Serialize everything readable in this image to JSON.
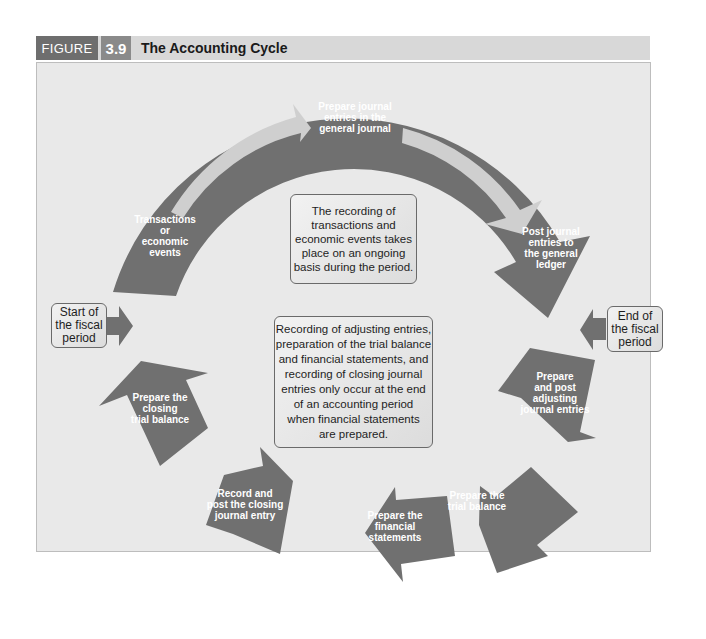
{
  "figure": {
    "label": "FIGURE",
    "number": "3.9",
    "title": "The Accounting Cycle"
  },
  "colors": {
    "arrow_fill": "#707070",
    "inner_arrow_fill": "#cfcfcf",
    "panel_background": "#e9e9e9",
    "header_background": "#d8d8d8",
    "figure_label_background": "#6e6e6e",
    "figure_number_background": "#8a8a8a"
  },
  "boxes": {
    "start": "Start of the fiscal period",
    "end": "End of the fiscal period",
    "ongoing_note": "The recording of transactions and economic events takes place on an ongoing basis during the period.",
    "end_of_period_note": "Recording of adjusting entries, preparation of the trial balance and financial statements, and recording of closing journal entries only occur at the end of an accounting period when financial statements are prepared."
  },
  "arc_steps": [
    {
      "id": "transactions",
      "label": "Transactions or economic events"
    },
    {
      "id": "journal-entries",
      "label": "Prepare journal entries in the general journal"
    },
    {
      "id": "post-ledger",
      "label": "Post journal entries to the general ledger"
    }
  ],
  "end_steps": [
    {
      "id": "adjusting",
      "label": "Prepare and post adjusting journal entries"
    },
    {
      "id": "trial-balance",
      "label": "Prepare the trial balance"
    },
    {
      "id": "financial-statements",
      "label": "Prepare the financial statements"
    },
    {
      "id": "closing-entry",
      "label": "Record and post the closing journal entry"
    },
    {
      "id": "closing-trial-balance",
      "label": "Prepare the closing trial balance"
    }
  ],
  "text": {
    "transactions": [
      "Transactions",
      "or",
      "economic",
      "events"
    ],
    "journal": [
      "Prepare journal",
      "entries in the",
      "general journal"
    ],
    "post": [
      "Post journal",
      "entries to",
      "the general",
      "ledger"
    ],
    "adjusting": [
      "Prepare",
      "and post",
      "adjusting",
      "journal entries"
    ],
    "trial": [
      "Prepare the",
      "trial balance"
    ],
    "financial": [
      "Prepare the",
      "financial",
      "statements"
    ],
    "closing_entry": [
      "Record and",
      "post the closing",
      "journal entry"
    ],
    "closing_trial": [
      "Prepare the",
      "closing",
      "trial balance"
    ],
    "start": [
      "Start of",
      "the fiscal",
      "period"
    ],
    "end": [
      "End of",
      "the fiscal",
      "period"
    ],
    "ongoing": [
      "The recording of",
      "transactions and",
      "economic events takes",
      "place on an ongoing",
      "basis during the period."
    ],
    "end_note": [
      "Recording of adjusting entries,",
      "preparation of the trial balance",
      "and financial statements, and",
      "recording of closing journal",
      "entries only occur at the end",
      "of an accounting period",
      "when financial statements",
      "are prepared."
    ]
  }
}
